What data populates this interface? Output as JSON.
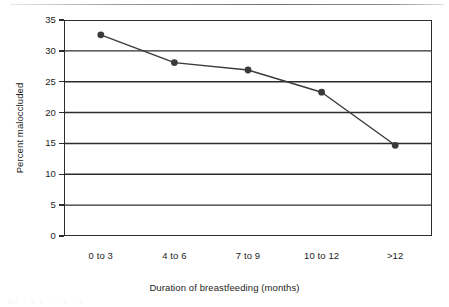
{
  "figure": {
    "top_rule_present": true,
    "caption_artifact": "NL - L L - - L - L",
    "frame_color": "#2c2c2c",
    "series_color": "#3a3a3a"
  },
  "chart_data": {
    "type": "line",
    "title": "",
    "subtitle": "",
    "xlabel": "Duration of breastfeeding (months)",
    "ylabel": "Percent maloccluded",
    "categories": [
      "0 to 3",
      "4 to 6",
      "7 to 9",
      "10 to 12",
      ">12"
    ],
    "values": [
      32.6,
      28.1,
      26.9,
      23.3,
      14.7
    ],
    "series": [
      {
        "name": "Percent maloccluded",
        "values": [
          32.6,
          28.1,
          26.9,
          23.3,
          14.7
        ]
      }
    ],
    "ylim": [
      0,
      35
    ],
    "yticks": [
      0,
      5,
      10,
      15,
      20,
      25,
      30,
      35
    ],
    "ytick_labels": [
      "0",
      "5",
      "10",
      "15",
      "20",
      "25",
      "30",
      "35"
    ],
    "grid": "horizontal",
    "gridlines_y": [
      5,
      10,
      15,
      20,
      25,
      30
    ],
    "legend": "none",
    "legend_position": "none",
    "markers": "filled-circle",
    "annotations": []
  }
}
